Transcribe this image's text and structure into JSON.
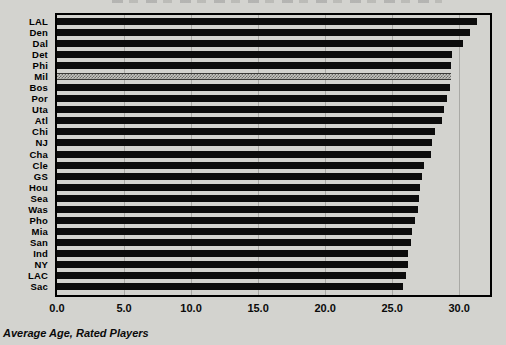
{
  "page": {
    "caption": "Average Age, Rated Players"
  },
  "chart_data": {
    "type": "bar",
    "orientation": "horizontal",
    "title": "",
    "categories": [
      "LAL",
      "Den",
      "Dal",
      "Det",
      "Phi",
      "Mil",
      "Bos",
      "Por",
      "Uta",
      "Atl",
      "Chi",
      "NJ",
      "Cha",
      "Cle",
      "GS",
      "Hou",
      "Sea",
      "Was",
      "Pho",
      "Mia",
      "San",
      "Ind",
      "NY",
      "LAC",
      "Sac"
    ],
    "values": [
      31.3,
      30.8,
      30.3,
      29.5,
      29.4,
      29.4,
      29.3,
      29.1,
      28.9,
      28.7,
      28.2,
      28.0,
      27.9,
      27.4,
      27.2,
      27.1,
      27.0,
      26.9,
      26.7,
      26.5,
      26.4,
      26.2,
      26.2,
      26.0,
      25.8
    ],
    "highlight_category": "Mil",
    "highlight_style": "gray-checkerboard",
    "xlabel": "Average Age, Rated Players",
    "xticks": [
      0,
      5,
      10,
      15,
      20,
      25,
      30
    ],
    "xtick_labels": [
      "0.0",
      "5.0",
      "10.0",
      "15.0",
      "20.0",
      "25.0",
      "30.0"
    ],
    "xlim": [
      0,
      32
    ],
    "grid": "vertical",
    "legend": "none",
    "colors": {
      "bar": "#0c0c0c",
      "highlight_fill": "#9a9a96",
      "background": "#d3d3cf",
      "frame": "#000000",
      "gridline": "#a9a9a5",
      "text": "#000000"
    }
  }
}
